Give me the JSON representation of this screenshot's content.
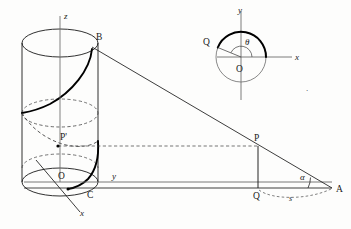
{
  "figure": {
    "stroke_color": "#1a1a1a",
    "helix_color": "#000000",
    "dash_color": "#3a3a3a",
    "background": "#fdfdfc"
  },
  "cylinder": {
    "axis_label_z": "z",
    "axis_label_y": "y",
    "axis_label_x": "x",
    "point_B": "B",
    "point_P_prime": "P'",
    "point_O": "O",
    "point_C": "C"
  },
  "triangle": {
    "point_P": "P",
    "point_Q": "Q",
    "point_A": "A",
    "angle_alpha": "α",
    "arc_s": "s"
  },
  "inset": {
    "axis_label_x": "x",
    "axis_label_y": "y",
    "point_O": "O",
    "point_Q": "Q",
    "angle_theta": "θ"
  },
  "stray_mark": {
    "text": "·"
  }
}
